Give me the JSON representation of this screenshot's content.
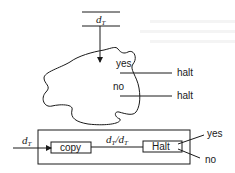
{
  "figure": {
    "tape": {
      "symbol": "d",
      "subscript": "T"
    },
    "blob": {
      "yes_label": "yes",
      "no_label": "no",
      "yes_output": "halt",
      "no_output": "halt"
    },
    "machine": {
      "input_symbol": "d",
      "input_subscript": "T",
      "copy_label": "copy",
      "middle_symbol_a": "d",
      "middle_subscript_a": "T",
      "middle_slash": "/",
      "middle_symbol_b": "d",
      "middle_subscript_b": "T",
      "halt_label": "Halt",
      "yes_label": "yes",
      "no_label": "no"
    }
  },
  "colors": {
    "line": "#1a1a1a",
    "background": "#ffffff"
  }
}
